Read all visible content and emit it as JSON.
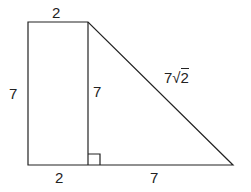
{
  "figure": {
    "labels": {
      "top_width": "2",
      "left_height": "7",
      "inner_height": "7",
      "hypotenuse_coef": "7",
      "hypotenuse_radicand": "2",
      "bottom_left": "2",
      "bottom_right": "7"
    },
    "colors": {
      "stroke": "#222222",
      "background": "#ffffff"
    }
  }
}
